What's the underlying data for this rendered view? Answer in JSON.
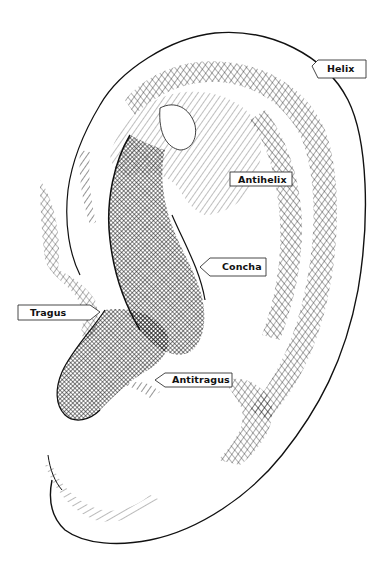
{
  "diagram": {
    "labels": [
      {
        "id": "helix",
        "text": "Helix",
        "pointer": "left"
      },
      {
        "id": "antihelix",
        "text": "Antihelix",
        "pointer": "none"
      },
      {
        "id": "concha",
        "text": "Concha",
        "pointer": "left"
      },
      {
        "id": "tragus",
        "text": "Tragus",
        "pointer": "right"
      },
      {
        "id": "antitragus",
        "text": "Antitragus",
        "pointer": "left"
      }
    ]
  },
  "colors": {
    "ink": "#111111",
    "background": "#ffffff",
    "label_border": "#333333"
  }
}
